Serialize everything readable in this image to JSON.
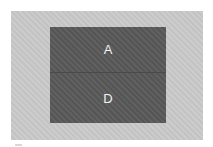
{
  "diagram": {
    "background_color": "#c9c9c9",
    "block_color": "#5a5a5a",
    "label_color": "#f2f2f2",
    "regions": [
      {
        "label": "A"
      },
      {
        "label": "D"
      }
    ]
  }
}
